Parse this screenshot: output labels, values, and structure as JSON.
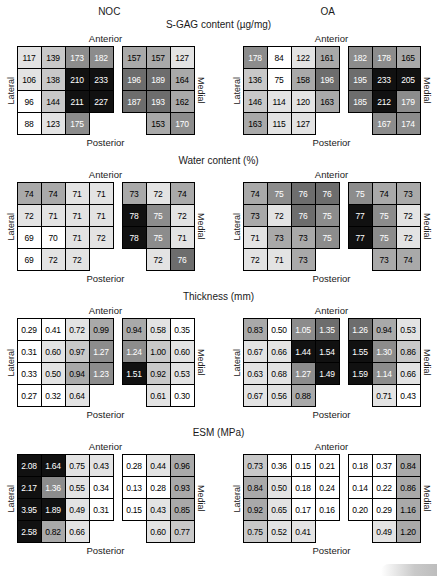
{
  "palette": {
    "shade_colors": [
      "#ffffff",
      "#e3e3e3",
      "#c8c8c8",
      "#a9a9a9",
      "#8c8c8c",
      "#6d6d6d",
      "#111111"
    ],
    "light_text_shade_min": 4,
    "grid_line_color": "#000000"
  },
  "groups": [
    "NOC",
    "OA"
  ],
  "layout_labels": {
    "anterior": "Anterior",
    "posterior": "Posterior",
    "lateral": "Lateral",
    "medial": "Medial"
  },
  "chart_data": [
    {
      "type": "heatmap",
      "title": "S-GAG content (µg/mg)",
      "groups": [
        {
          "name": "NOC",
          "lateral": {
            "values": [
              [
                "117",
                "139",
                "173",
                "182"
              ],
              [
                "106",
                "138",
                "210",
                "233"
              ],
              [
                "96",
                "144",
                "211",
                "227"
              ],
              [
                "88",
                "123",
                "175",
                null
              ]
            ],
            "shades": [
              [
                1,
                2,
                4,
                4
              ],
              [
                1,
                2,
                6,
                6
              ],
              [
                0,
                2,
                6,
                6
              ],
              [
                0,
                1,
                4,
                null
              ]
            ]
          },
          "medial": {
            "values": [
              [
                "157",
                "157",
                "127"
              ],
              [
                "196",
                "189",
                "164"
              ],
              [
                "187",
                "193",
                "162"
              ],
              [
                null,
                "153",
                "170"
              ]
            ],
            "shades": [
              [
                3,
                3,
                1
              ],
              [
                5,
                5,
                3
              ],
              [
                5,
                5,
                3
              ],
              [
                null,
                3,
                4
              ]
            ]
          }
        },
        {
          "name": "OA",
          "lateral": {
            "values": [
              [
                "178",
                "84",
                "122",
                "161"
              ],
              [
                "136",
                "75",
                "158",
                "196"
              ],
              [
                "146",
                "114",
                "120",
                "163"
              ],
              [
                "163",
                "115",
                "127",
                null
              ]
            ],
            "shades": [
              [
                4,
                0,
                1,
                3
              ],
              [
                2,
                0,
                3,
                5
              ],
              [
                2,
                1,
                1,
                3
              ],
              [
                3,
                1,
                1,
                null
              ]
            ]
          },
          "medial": {
            "values": [
              [
                "182",
                "178",
                "165"
              ],
              [
                "195",
                "233",
                "205"
              ],
              [
                "185",
                "212",
                "179"
              ],
              [
                null,
                "167",
                "174"
              ]
            ],
            "shades": [
              [
                4,
                4,
                3
              ],
              [
                5,
                6,
                6
              ],
              [
                5,
                6,
                4
              ],
              [
                null,
                4,
                4
              ]
            ]
          }
        }
      ]
    },
    {
      "type": "heatmap",
      "title": "Water content (%)",
      "groups": [
        {
          "name": "NOC",
          "lateral": {
            "values": [
              [
                "74",
                "74",
                "71",
                "71"
              ],
              [
                "72",
                "71",
                "71",
                "71"
              ],
              [
                "69",
                "70",
                "71",
                "72"
              ],
              [
                "69",
                "72",
                "72",
                null
              ]
            ],
            "shades": [
              [
                3,
                3,
                1,
                1
              ],
              [
                1,
                1,
                1,
                1
              ],
              [
                0,
                0,
                1,
                1
              ],
              [
                0,
                1,
                1,
                null
              ]
            ]
          },
          "medial": {
            "values": [
              [
                "73",
                "72",
                "74"
              ],
              [
                "78",
                "75",
                "72"
              ],
              [
                "78",
                "75",
                "71"
              ],
              [
                null,
                "72",
                "76"
              ]
            ],
            "shades": [
              [
                3,
                1,
                3
              ],
              [
                6,
                4,
                1
              ],
              [
                6,
                4,
                1
              ],
              [
                null,
                1,
                5
              ]
            ]
          }
        },
        {
          "name": "OA",
          "lateral": {
            "values": [
              [
                "74",
                "75",
                "76",
                "76"
              ],
              [
                "73",
                "72",
                "76",
                "75"
              ],
              [
                "71",
                "73",
                "73",
                "75"
              ],
              [
                "72",
                "71",
                "73",
                null
              ]
            ],
            "shades": [
              [
                3,
                4,
                5,
                5
              ],
              [
                3,
                1,
                5,
                4
              ],
              [
                1,
                3,
                3,
                4
              ],
              [
                1,
                1,
                3,
                null
              ]
            ]
          },
          "medial": {
            "values": [
              [
                "75",
                "74",
                "73"
              ],
              [
                "77",
                "75",
                "72"
              ],
              [
                "77",
                "75",
                "72"
              ],
              [
                null,
                "73",
                "74"
              ]
            ],
            "shades": [
              [
                4,
                3,
                3
              ],
              [
                6,
                4,
                1
              ],
              [
                6,
                4,
                1
              ],
              [
                null,
                3,
                3
              ]
            ]
          }
        }
      ]
    },
    {
      "type": "heatmap",
      "title": "Thickness (mm)",
      "groups": [
        {
          "name": "NOC",
          "lateral": {
            "values": [
              [
                "0.29",
                "0.41",
                "0.72",
                "0.99"
              ],
              [
                "0.31",
                "0.60",
                "0.97",
                "1.27"
              ],
              [
                "0.33",
                "0.50",
                "0.94",
                "1.23"
              ],
              [
                "0.27",
                "0.32",
                "0.64",
                null
              ]
            ],
            "shades": [
              [
                0,
                0,
                1,
                3
              ],
              [
                0,
                1,
                2,
                4
              ],
              [
                0,
                1,
                3,
                4
              ],
              [
                0,
                0,
                1,
                null
              ]
            ]
          },
          "medial": {
            "values": [
              [
                "0.94",
                "0.58",
                "0.35"
              ],
              [
                "1.24",
                "1.00",
                "0.60"
              ],
              [
                "1.51",
                "0.92",
                "0.53"
              ],
              [
                null,
                "0.61",
                "0.30"
              ]
            ],
            "shades": [
              [
                3,
                1,
                0
              ],
              [
                4,
                2,
                1
              ],
              [
                6,
                2,
                1
              ],
              [
                null,
                1,
                0
              ]
            ]
          }
        },
        {
          "name": "OA",
          "lateral": {
            "values": [
              [
                "0.83",
                "0.50",
                "1.05",
                "1.35"
              ],
              [
                "0.67",
                "0.66",
                "1.44",
                "1.54"
              ],
              [
                "0.63",
                "0.68",
                "1.27",
                "1.49"
              ],
              [
                "0.67",
                "0.56",
                "0.88",
                null
              ]
            ],
            "shades": [
              [
                3,
                0,
                4,
                5
              ],
              [
                1,
                1,
                6,
                6
              ],
              [
                1,
                1,
                4,
                6
              ],
              [
                1,
                1,
                3,
                null
              ]
            ]
          },
          "medial": {
            "values": [
              [
                "1.26",
                "0.94",
                "0.53"
              ],
              [
                "1.55",
                "1.30",
                "0.86"
              ],
              [
                "1.59",
                "1.14",
                "0.66"
              ],
              [
                null,
                "0.71",
                "0.43"
              ]
            ],
            "shades": [
              [
                5,
                3,
                1
              ],
              [
                6,
                4,
                2
              ],
              [
                6,
                4,
                1
              ],
              [
                null,
                1,
                0
              ]
            ]
          }
        }
      ]
    },
    {
      "type": "heatmap",
      "title": "ESM (MPa)",
      "groups": [
        {
          "name": "NOC",
          "lateral": {
            "values": [
              [
                "2.08",
                "1.64",
                "0.75",
                "0.43"
              ],
              [
                "2.17",
                "1.36",
                "0.55",
                "0.34"
              ],
              [
                "3.95",
                "1.89",
                "0.49",
                "0.31"
              ],
              [
                "2.58",
                "0.82",
                "0.66",
                null
              ]
            ],
            "shades": [
              [
                6,
                6,
                1,
                1
              ],
              [
                6,
                4,
                1,
                0
              ],
              [
                6,
                6,
                1,
                0
              ],
              [
                6,
                3,
                1,
                null
              ]
            ]
          },
          "medial": {
            "values": [
              [
                "0.28",
                "0.44",
                "0.96"
              ],
              [
                "0.13",
                "0.28",
                "0.93"
              ],
              [
                "0.15",
                "0.43",
                "0.85"
              ],
              [
                null,
                "0.60",
                "0.77"
              ]
            ],
            "shades": [
              [
                0,
                1,
                3
              ],
              [
                0,
                0,
                3
              ],
              [
                0,
                1,
                3
              ],
              [
                null,
                1,
                2
              ]
            ]
          }
        },
        {
          "name": "OA",
          "lateral": {
            "values": [
              [
                "0.73",
                "0.36",
                "0.15",
                "0.21"
              ],
              [
                "0.84",
                "0.50",
                "0.18",
                "0.24"
              ],
              [
                "0.92",
                "0.65",
                "0.17",
                "0.16"
              ],
              [
                "0.75",
                "0.52",
                "0.41",
                null
              ]
            ],
            "shades": [
              [
                2,
                0,
                0,
                0
              ],
              [
                3,
                1,
                0,
                0
              ],
              [
                3,
                1,
                0,
                0
              ],
              [
                2,
                1,
                1,
                null
              ]
            ]
          },
          "medial": {
            "values": [
              [
                "0.18",
                "0.37",
                "0.84"
              ],
              [
                "0.14",
                "0.22",
                "0.86"
              ],
              [
                "0.20",
                "0.29",
                "1.16"
              ],
              [
                null,
                "0.49",
                "1.20"
              ]
            ],
            "shades": [
              [
                0,
                0,
                3
              ],
              [
                0,
                0,
                3
              ],
              [
                0,
                0,
                3
              ],
              [
                null,
                1,
                3
              ]
            ]
          }
        }
      ]
    }
  ]
}
